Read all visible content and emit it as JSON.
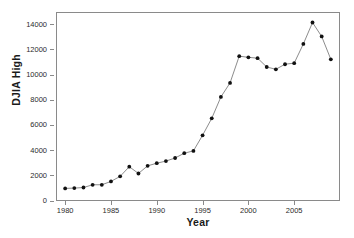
{
  "chart_data": {
    "type": "line",
    "title": "",
    "xlabel": "Year",
    "ylabel": "DJIA High",
    "xlim": [
      1979,
      2010
    ],
    "ylim": [
      0,
      15000
    ],
    "grid": false,
    "legend": false,
    "legend_position": "none",
    "marker": "filled-circle",
    "line_color": "#6f6f6f",
    "marker_color": "#111111",
    "x_tick_labels": [
      "1980",
      "1985",
      "1990",
      "1995",
      "2000",
      "2005"
    ],
    "x_tick_values": [
      1980,
      1985,
      1990,
      1995,
      2000,
      2005
    ],
    "y_tick_labels": [
      "0",
      "2000",
      "4000",
      "6000",
      "8000",
      "10000",
      "12000",
      "14000"
    ],
    "y_tick_values": [
      0,
      2000,
      4000,
      6000,
      8000,
      10000,
      12000,
      14000
    ],
    "x": [
      1980,
      1981,
      1982,
      1983,
      1984,
      1985,
      1986,
      1987,
      1988,
      1989,
      1990,
      1991,
      1992,
      1993,
      1994,
      1995,
      1996,
      1997,
      1998,
      1999,
      2000,
      2001,
      2002,
      2003,
      2004,
      2005,
      2006,
      2007,
      2008,
      2009
    ],
    "values": [
      1000,
      1024,
      1070,
      1287,
      1287,
      1553,
      1956,
      2722,
      2184,
      2791,
      2999,
      3169,
      3413,
      3794,
      3978,
      5216,
      6560,
      8259,
      9374,
      11497,
      11401,
      11338,
      10635,
      10454,
      10855,
      10941,
      12464,
      14165,
      13058,
      11244
    ],
    "series": [
      {
        "name": "DJIA High",
        "points": [
          {
            "x": 1980,
            "y": 1000
          },
          {
            "x": 1981,
            "y": 1024
          },
          {
            "x": 1982,
            "y": 1070
          },
          {
            "x": 1983,
            "y": 1287
          },
          {
            "x": 1984,
            "y": 1287
          },
          {
            "x": 1985,
            "y": 1553
          },
          {
            "x": 1986,
            "y": 1956
          },
          {
            "x": 1987,
            "y": 2722
          },
          {
            "x": 1988,
            "y": 2184
          },
          {
            "x": 1989,
            "y": 2791
          },
          {
            "x": 1990,
            "y": 2999
          },
          {
            "x": 1991,
            "y": 3169
          },
          {
            "x": 1992,
            "y": 3413
          },
          {
            "x": 1993,
            "y": 3794
          },
          {
            "x": 1994,
            "y": 3978
          },
          {
            "x": 1995,
            "y": 5216
          },
          {
            "x": 1996,
            "y": 6560
          },
          {
            "x": 1997,
            "y": 8259
          },
          {
            "x": 1998,
            "y": 9374
          },
          {
            "x": 1999,
            "y": 11497
          },
          {
            "x": 2000,
            "y": 11401
          },
          {
            "x": 2001,
            "y": 11338
          },
          {
            "x": 2002,
            "y": 10635
          },
          {
            "x": 2003,
            "y": 10454
          },
          {
            "x": 2004,
            "y": 10855
          },
          {
            "x": 2005,
            "y": 10941
          },
          {
            "x": 2006,
            "y": 12464
          },
          {
            "x": 2007,
            "y": 14165
          },
          {
            "x": 2008,
            "y": 13058
          },
          {
            "x": 2009,
            "y": 11244
          }
        ]
      }
    ]
  }
}
